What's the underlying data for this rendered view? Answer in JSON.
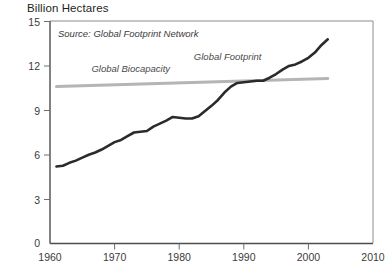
{
  "chart_data": {
    "type": "line",
    "title": "Billion Hectares",
    "source_note": "Source: Global Footprint Network",
    "xlabel": "",
    "ylabel": "Billion Hectares",
    "xlim": [
      1960,
      2010
    ],
    "ylim": [
      0,
      15
    ],
    "xticks": [
      1960,
      1970,
      1980,
      1990,
      2000,
      2010
    ],
    "xtick_labels": [
      "1960",
      "1970",
      "1980",
      "1990",
      "2000",
      "2010"
    ],
    "yticks": [
      0,
      3,
      6,
      9,
      12,
      15
    ],
    "ytick_labels": [
      "0",
      "3",
      "6",
      "9",
      "12",
      "15"
    ],
    "grid": false,
    "legend": "inline-annotations",
    "series": [
      {
        "name": "Global Footprint",
        "color": "#2b2b2b",
        "label_x": 1987.5,
        "label_y": 12.4,
        "x": [
          1961,
          1962,
          1963,
          1964,
          1965,
          1966,
          1967,
          1968,
          1969,
          1970,
          1971,
          1972,
          1973,
          1974,
          1975,
          1976,
          1977,
          1978,
          1979,
          1980,
          1981,
          1982,
          1983,
          1984,
          1985,
          1986,
          1987,
          1988,
          1989,
          1990,
          1991,
          1992,
          1993,
          1994,
          1995,
          1996,
          1997,
          1998,
          1999,
          2000,
          2001,
          2002,
          2003
        ],
        "values": [
          5.2,
          5.25,
          5.45,
          5.6,
          5.8,
          6.0,
          6.15,
          6.35,
          6.6,
          6.85,
          7.0,
          7.25,
          7.5,
          7.55,
          7.6,
          7.9,
          8.1,
          8.3,
          8.55,
          8.5,
          8.45,
          8.45,
          8.6,
          8.95,
          9.3,
          9.7,
          10.2,
          10.6,
          10.85,
          10.9,
          10.95,
          11.0,
          11.0,
          11.2,
          11.45,
          11.75,
          12.0,
          12.1,
          12.3,
          12.55,
          12.9,
          13.4,
          13.8
        ]
      },
      {
        "name": "Global Biocapacity",
        "color": "#b5b5b5",
        "label_x": 1972.5,
        "label_y": 11.6,
        "x": [
          1961,
          2003
        ],
        "values": [
          10.6,
          11.15
        ]
      }
    ]
  }
}
